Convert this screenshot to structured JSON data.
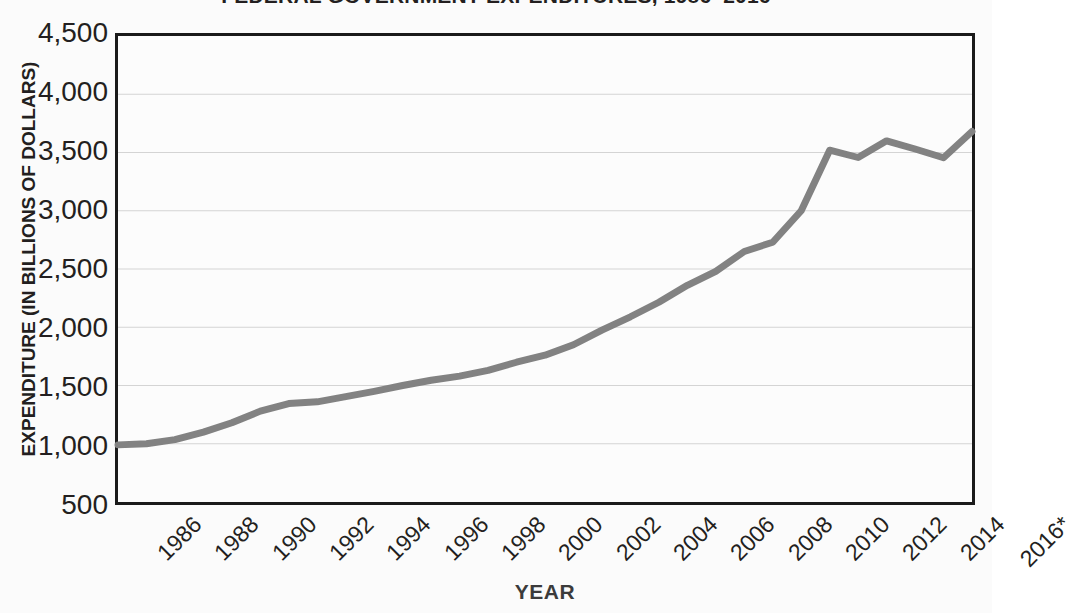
{
  "chart_data": {
    "type": "line",
    "title": "FEDERAL GOVERNMENT EXPENDITURES, 1986–2016",
    "xlabel": "YEAR",
    "ylabel": "EXPENDITURE (IN BILLIONS OF DOLLARS)",
    "ylim": [
      500,
      4500
    ],
    "ytick_labels": [
      "4,500",
      "4,000",
      "3,500",
      "3,000",
      "2,500",
      "2,000",
      "1,500",
      "1,000",
      "500"
    ],
    "ytick_values": [
      4500,
      4000,
      3500,
      3000,
      2500,
      2000,
      1500,
      1000,
      500
    ],
    "xlim": [
      1986,
      2016
    ],
    "xtick_labels": [
      "1986",
      "1988",
      "1990",
      "1992",
      "1994",
      "1996",
      "1998",
      "2000",
      "2002",
      "2004",
      "2006",
      "2008",
      "2010",
      "2012",
      "2014",
      "2016*"
    ],
    "xtick_values": [
      1986,
      1988,
      1990,
      1992,
      1994,
      1996,
      1998,
      2000,
      2002,
      2004,
      2006,
      2008,
      2010,
      2012,
      2014,
      2016
    ],
    "grid": true,
    "legend": "none",
    "series": [
      {
        "name": "Federal government expenditures",
        "color": "#828282",
        "x": [
          1986,
          1987,
          1988,
          1989,
          1990,
          1991,
          1992,
          1993,
          1994,
          1995,
          1996,
          1997,
          1998,
          1999,
          2000,
          2001,
          2002,
          2003,
          2004,
          2005,
          2006,
          2007,
          2008,
          2009,
          2010,
          2011,
          2012,
          2013,
          2014,
          2015,
          2016
        ],
        "values": [
          990,
          1000,
          1035,
          1100,
          1180,
          1280,
          1345,
          1360,
          1405,
          1450,
          1500,
          1545,
          1580,
          1630,
          1700,
          1760,
          1850,
          1975,
          2090,
          2215,
          2360,
          2480,
          2650,
          2730,
          3000,
          3520,
          3457,
          3600,
          3530,
          3455,
          3680
        ]
      }
    ],
    "footnote_marker": "*"
  },
  "annotations": {
    "x_axis_label_rotation_deg": -45
  }
}
